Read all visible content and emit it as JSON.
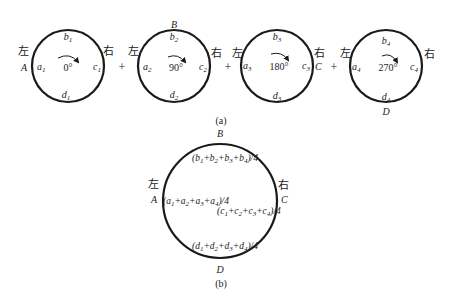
{
  "figure": {
    "panel_a": {
      "caption": "(a)",
      "plus_sign": "+",
      "circles": [
        {
          "angle": "0°",
          "left_char": "左",
          "right_char": "右",
          "a": {
            "base": "a",
            "sub": "1"
          },
          "b": {
            "base": "b",
            "sub": "1"
          },
          "c": {
            "base": "c",
            "sub": "1"
          },
          "d": {
            "base": "d",
            "sub": "1"
          },
          "outer_left_point": "A"
        },
        {
          "angle": "90°",
          "left_char": "左",
          "right_char": "右",
          "a": {
            "base": "a",
            "sub": "2"
          },
          "b": {
            "base": "b",
            "sub": "2"
          },
          "c": {
            "base": "c",
            "sub": "2"
          },
          "d": {
            "base": "d",
            "sub": "2"
          },
          "outer_top_point": "B"
        },
        {
          "angle": "180°",
          "left_char": "左",
          "right_char": "右",
          "a": {
            "base": "a",
            "sub": "3"
          },
          "b": {
            "base": "b",
            "sub": "3"
          },
          "c": {
            "base": "c",
            "sub": "3"
          },
          "d": {
            "base": "d",
            "sub": "3"
          },
          "outer_right_point": "C"
        },
        {
          "angle": "270°",
          "left_char": "左",
          "right_char": "右",
          "a": {
            "base": "a",
            "sub": "4"
          },
          "b": {
            "base": "b",
            "sub": "4"
          },
          "c": {
            "base": "c",
            "sub": "4"
          },
          "d": {
            "base": "d",
            "sub": "4"
          },
          "outer_bottom_point": "D"
        }
      ]
    },
    "panel_b": {
      "caption": "(b)",
      "left_char": "左",
      "right_char": "右",
      "points": {
        "A": "A",
        "B": "B",
        "C": "C",
        "D": "D"
      },
      "formula_b": "(b1+b2+b3+b4)/4",
      "formula_a": "(a1+a2+a3+a4)/4",
      "formula_c": "(c1+c2+c3+c4)/4",
      "formula_d": "(d1+d2+d3+d4)/4",
      "parts": {
        "open": "(",
        "close": ")/4",
        "plus": "+"
      }
    },
    "colors": {
      "stroke": "#1a1a1a",
      "text": "#222222",
      "background": "#ffffff"
    }
  }
}
